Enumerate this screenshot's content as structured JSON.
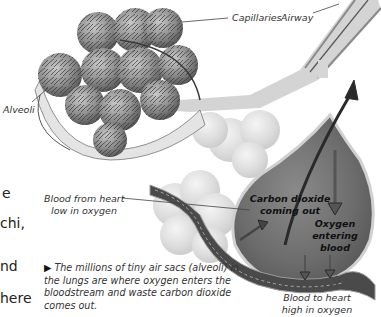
{
  "labels": {
    "capillaries": "Capillaries",
    "airway": "Airway",
    "alveoli": "Alveoli",
    "blood_from_heart_line1": "Blood from heart",
    "blood_from_heart_line2": "low in oxygen",
    "co2_line1": "Carbon dioxide",
    "co2_line2": "coming out",
    "o2_line1": "Oxygen",
    "o2_line2": "entering",
    "o2_line3": "blood",
    "blood_to_heart_line1": "Blood to heart",
    "blood_to_heart_line2": "high in oxygen"
  },
  "body_text_fragments": [
    "e",
    "chi,",
    "nd",
    "here"
  ],
  "caption": {
    "marker": "▶",
    "text": "The millions of tiny air sacs (alveoli) in the lungs are where oxygen enters the bloodstream and waste carbon dioxide comes out."
  },
  "colors": {
    "background": "#ffffff",
    "alveolus_fill": "#9a9a9a",
    "capillary_net": "#3e3e3e",
    "airway": "#c8c8c8",
    "sac_fill": "#6e6e6e",
    "arrow": "#2a2a2a"
  }
}
